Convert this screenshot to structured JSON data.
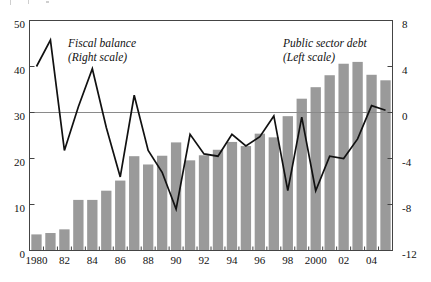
{
  "chart_data": {
    "type": "bar",
    "title": "",
    "subtitle": "",
    "xlabel": "",
    "ylabel": "",
    "grid": false,
    "zero_line": true,
    "legend_position": "inside-annotations",
    "categories": [
      "1980",
      "1981",
      "1982",
      "1983",
      "1984",
      "1985",
      "1986",
      "1987",
      "1988",
      "1989",
      "1990",
      "1991",
      "1992",
      "1993",
      "1994",
      "1995",
      "1996",
      "1997",
      "1998",
      "1999",
      "2000",
      "2001",
      "2002",
      "2003",
      "2004",
      "2005"
    ],
    "x_tick_labels": [
      "1980",
      "",
      "82",
      "",
      "84",
      "",
      "86",
      "",
      "88",
      "",
      "90",
      "",
      "92",
      "",
      "94",
      "",
      "96",
      "",
      "98",
      "",
      "2000",
      "",
      "02",
      "",
      "04",
      ""
    ],
    "axes": {
      "left": {
        "label": "",
        "ylim": [
          0,
          50
        ],
        "ticks": [
          0,
          10,
          20,
          30,
          40,
          50
        ],
        "tick_labels": [
          "0",
          "10",
          "20",
          "30",
          "40",
          "50"
        ]
      },
      "right": {
        "label": "",
        "ylim": [
          -12,
          8
        ],
        "ticks": [
          -12,
          -8,
          -4,
          0,
          4,
          8
        ],
        "tick_labels": [
          "-12",
          "-8",
          "-4",
          "0",
          "4",
          "8"
        ]
      }
    },
    "series": [
      {
        "name": "Public sector debt",
        "type": "bar",
        "axis": "left",
        "color": "#9a9a9a",
        "annotation": "Public sector debt\n(Left scale)",
        "values": [
          3.5,
          3.8,
          4.6,
          11.0,
          11.0,
          13.0,
          15.2,
          20.5,
          18.7,
          20.6,
          23.5,
          19.6,
          20.7,
          21.9,
          23.6,
          22.7,
          25.4,
          24.6,
          29.2,
          33.0,
          35.5,
          38.1,
          40.6,
          41.0,
          38.2,
          37.0
        ]
      },
      {
        "name": "Fiscal balance",
        "type": "line",
        "axis": "right",
        "color": "#111111",
        "annotation": "Fiscal balance\n(Right scale)",
        "values": [
          4.0,
          6.3,
          -3.3,
          0.5,
          3.8,
          -1.3,
          -5.6,
          1.5,
          -3.3,
          -5.2,
          -8.4,
          -1.9,
          -3.6,
          -3.8,
          -1.9,
          -2.9,
          -2.1,
          -0.3,
          -6.8,
          -0.4,
          -6.8,
          -3.8,
          -4.0,
          -2.3,
          0.6,
          0.2
        ]
      }
    ]
  },
  "annotations": {
    "fiscal_balance_line1": "Fiscal balance",
    "fiscal_balance_line2": "(Right scale)",
    "public_debt_line1": "Public sector debt",
    "public_debt_line2": "(Left scale)"
  },
  "axis_left_labels": {
    "t0": "0",
    "t1": "10",
    "t2": "20",
    "t3": "30",
    "t4": "40",
    "t5": "50"
  },
  "axis_right_labels": {
    "t0": "-12",
    "t1": "-8",
    "t2": "-4",
    "t3": "0",
    "t4": "4",
    "t5": "8"
  },
  "axis_x_labels": {
    "l0": "1980",
    "l1": "82",
    "l2": "84",
    "l3": "86",
    "l4": "88",
    "l5": "90",
    "l6": "92",
    "l7": "94",
    "l8": "96",
    "l9": "98",
    "l10": "2000",
    "l11": "02",
    "l12": "04"
  },
  "colors": {
    "bar_fill": "#9a9a9a",
    "line_stroke": "#111111",
    "axis_stroke": "#444444",
    "zero_line": "#8a8a8a",
    "text": "#111111"
  }
}
